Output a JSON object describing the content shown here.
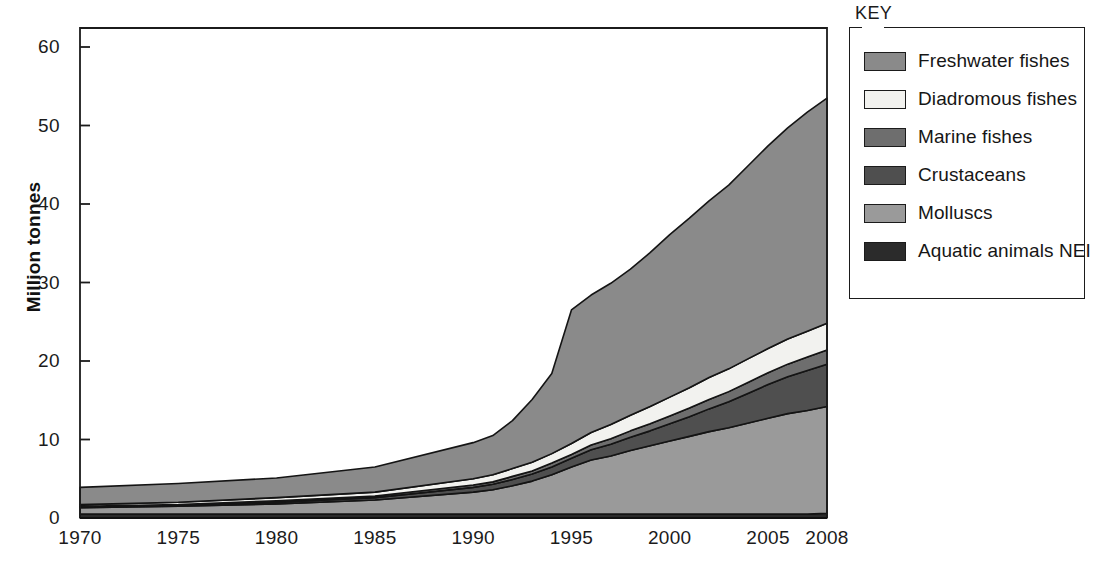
{
  "axes": {
    "y_title": "Million tonnes",
    "y_ticks": [
      "0",
      "10",
      "20",
      "30",
      "40",
      "50",
      "60"
    ],
    "x_ticks": [
      "1970",
      "1975",
      "1980",
      "1985",
      "1990",
      "1995",
      "2000",
      "2005",
      "2008"
    ]
  },
  "legend": {
    "title": "KEY",
    "items": [
      {
        "label": "Freshwater fishes",
        "color": "#8a8a8a"
      },
      {
        "label": "Diadromous fishes",
        "color": "#f2f2ef"
      },
      {
        "label": "Marine fishes",
        "color": "#6e6e6e"
      },
      {
        "label": "Crustaceans",
        "color": "#4f4f4f"
      },
      {
        "label": "Molluscs",
        "color": "#9a9a9a"
      },
      {
        "label": "Aquatic animals NEI",
        "color": "#2b2b2b"
      }
    ]
  },
  "chart_data": {
    "type": "area",
    "stacked": true,
    "title": "",
    "xlabel": "",
    "ylabel": "Million tonnes",
    "xlim": [
      1970,
      2008
    ],
    "ylim": [
      0,
      62
    ],
    "ytick_values": [
      0,
      10,
      20,
      30,
      40,
      50,
      60
    ],
    "grid": false,
    "legend_position": "right",
    "x": [
      1970,
      1975,
      1980,
      1985,
      1990,
      1991,
      1992,
      1993,
      1994,
      1995,
      1996,
      1997,
      1998,
      1999,
      2000,
      2001,
      2002,
      2003,
      2004,
      2005,
      2006,
      2007,
      2008
    ],
    "stack_order_bottom_to_top": [
      "Aquatic animals NEI",
      "Molluscs",
      "Crustaceans",
      "Marine fishes",
      "Diadromous fishes",
      "Freshwater fishes"
    ],
    "series": [
      {
        "name": "Aquatic animals NEI",
        "color": "#2b2b2b",
        "values": [
          0.5,
          0.5,
          0.5,
          0.5,
          0.5,
          0.5,
          0.5,
          0.5,
          0.5,
          0.5,
          0.5,
          0.5,
          0.5,
          0.5,
          0.5,
          0.5,
          0.5,
          0.5,
          0.5,
          0.5,
          0.5,
          0.5,
          0.6
        ]
      },
      {
        "name": "Molluscs",
        "color": "#9a9a9a",
        "values": [
          0.8,
          1.0,
          1.3,
          1.8,
          2.8,
          3.1,
          3.6,
          4.2,
          5.0,
          6.0,
          6.9,
          7.4,
          8.1,
          8.7,
          9.3,
          9.9,
          10.5,
          11.0,
          11.6,
          12.2,
          12.8,
          13.2,
          13.6
        ]
      },
      {
        "name": "Crustaceans",
        "color": "#4f4f4f",
        "values": [
          0.1,
          0.1,
          0.2,
          0.3,
          0.6,
          0.7,
          0.8,
          0.9,
          1.0,
          1.1,
          1.3,
          1.5,
          1.7,
          1.9,
          2.2,
          2.5,
          2.9,
          3.3,
          3.8,
          4.3,
          4.7,
          5.1,
          5.4
        ]
      },
      {
        "name": "Marine fishes",
        "color": "#6e6e6e",
        "values": [
          0.1,
          0.1,
          0.2,
          0.2,
          0.3,
          0.3,
          0.4,
          0.4,
          0.5,
          0.5,
          0.6,
          0.7,
          0.8,
          0.9,
          1.0,
          1.1,
          1.2,
          1.3,
          1.4,
          1.5,
          1.6,
          1.7,
          1.8
        ]
      },
      {
        "name": "Diadromous fishes",
        "color": "#f2f2ef",
        "values": [
          0.2,
          0.3,
          0.4,
          0.5,
          0.8,
          0.9,
          1.0,
          1.1,
          1.2,
          1.4,
          1.6,
          1.8,
          2.0,
          2.2,
          2.4,
          2.6,
          2.8,
          2.9,
          3.0,
          3.1,
          3.2,
          3.3,
          3.4
        ]
      },
      {
        "name": "Freshwater fishes",
        "color": "#8a8a8a",
        "values": [
          2.2,
          2.4,
          2.5,
          3.2,
          4.6,
          5.0,
          6.1,
          8.0,
          10.2,
          17.0,
          17.5,
          18.0,
          18.6,
          19.6,
          20.7,
          21.6,
          22.5,
          23.4,
          24.6,
          25.8,
          26.9,
          27.9,
          28.7
        ]
      }
    ],
    "totals": [
      3.9,
      4.4,
      5.1,
      6.5,
      9.6,
      10.5,
      12.4,
      15.1,
      18.4,
      26.5,
      28.4,
      29.9,
      31.7,
      33.8,
      36.1,
      38.2,
      40.4,
      42.4,
      44.9,
      47.4,
      49.7,
      51.7,
      53.5
    ]
  }
}
